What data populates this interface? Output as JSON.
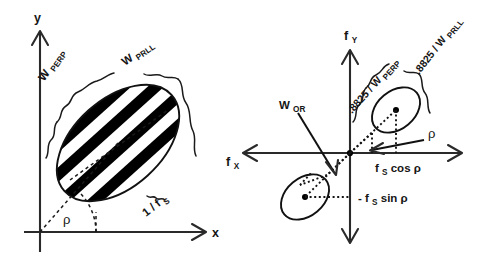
{
  "figure": {
    "background_color": "#ffffff",
    "ink_color": "#151515",
    "panels": [
      {
        "id": "spatial-domain",
        "name": "Spatial domain panel",
        "axes": {
          "x_label": "x",
          "y_label": "y"
        },
        "angle_label": "ρ",
        "labels": {
          "envelope_perp": "W",
          "envelope_perp_sub": "PERP",
          "envelope_prll": "W",
          "envelope_prll_sub": "PRLL",
          "period": "1 / f",
          "period_sub": "S"
        }
      },
      {
        "id": "fourier-domain",
        "name": "Fourier domain panel",
        "axes": {
          "x_label": "f",
          "x_label_sub": "X",
          "y_label": "f",
          "y_label_sub": "Y"
        },
        "angle_label": "ρ",
        "labels": {
          "bandwidth_perp": ".8825 / W",
          "bandwidth_perp_sub": "PERP",
          "bandwidth_prll": ".8825 / W",
          "bandwidth_prll_sub": "PRLL",
          "orientation_bw": "W",
          "orientation_bw_sub": "OR",
          "freq_x_component": "f",
          "freq_x_component_sub": "S",
          "freq_x_component_rest": " cos ρ",
          "freq_y_component": "- f",
          "freq_y_component_sub": "S",
          "freq_y_component_rest": " sin ρ"
        }
      }
    ]
  }
}
